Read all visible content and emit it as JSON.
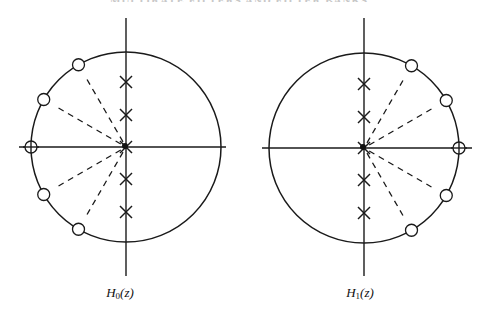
{
  "header": {
    "cutoff_text": "MULTIRATE FILTERS AND FILTER BANKS"
  },
  "diagrams": [
    {
      "id": "H0",
      "label_main": "H",
      "label_sub": "0",
      "label_tail": "(z)",
      "center": [
        126,
        147
      ],
      "radius": 95,
      "axis_h": [
        19,
        226
      ],
      "axis_v": [
        18,
        276
      ],
      "zero_angles_deg": [
        120,
        150,
        180,
        210,
        240
      ],
      "pole_offsets": [
        -65,
        -32,
        0,
        32,
        65
      ],
      "label_pos": [
        120,
        285
      ]
    },
    {
      "id": "H1",
      "label_main": "H",
      "label_sub": "1",
      "label_tail": "(z)",
      "center": [
        364,
        148
      ],
      "radius": 95,
      "axis_h": [
        262,
        472
      ],
      "axis_v": [
        18,
        276
      ],
      "zero_angles_deg": [
        60,
        30,
        0,
        -30,
        -60
      ],
      "pole_offsets": [
        -64,
        -31,
        0,
        32,
        65
      ],
      "label_pos": [
        360,
        285
      ]
    }
  ],
  "legend": {
    "zero_marker": "circle",
    "pole_marker": "cross"
  },
  "colors": {
    "ink": "#1a1a1a",
    "background": "#ffffff"
  }
}
